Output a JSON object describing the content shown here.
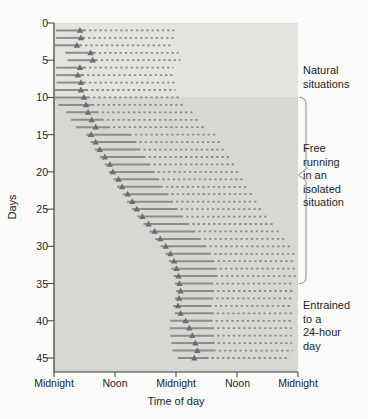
{
  "colors": {
    "page_bg": "#fbfbf9",
    "plot_bg_upper": "#e3e3e0",
    "plot_bg_lower": "#d7d7d3",
    "line": "#8c8e8c",
    "marker": "#6b6d70",
    "axis": "#3c3c3a",
    "bracket": "#8a8a88",
    "text": "#1e1e1e"
  },
  "chart_data": {
    "type": "actogram",
    "xlabel": "Time of day",
    "ylabel": "Days",
    "x_range_hours": [
      0,
      48
    ],
    "y_range_days": [
      0,
      45
    ],
    "grid": "off",
    "x_ticks": [
      {
        "hour": 0,
        "label": "Midnight"
      },
      {
        "hour": 12,
        "label": "Noon"
      },
      {
        "hour": 24,
        "label": "Midnight"
      },
      {
        "hour": 36,
        "label": "Noon"
      },
      {
        "hour": 48,
        "label": "Midnight"
      }
    ],
    "y_ticks": [
      "0",
      "5",
      "10",
      "15",
      "20",
      "25",
      "30",
      "35",
      "40",
      "45"
    ],
    "regimes": [
      {
        "label_lines": [
          "Natural",
          "situations"
        ],
        "day_start": 0,
        "day_end": 10,
        "bracket": false
      },
      {
        "label_lines": [
          "Free",
          "running",
          "in an",
          "isolated",
          "situation"
        ],
        "day_start": 10,
        "day_end": 35,
        "bracket": true
      },
      {
        "label_lines": [
          "Entrained",
          "to a",
          "24-hour",
          "day"
        ],
        "day_start": 35,
        "day_end": 45,
        "bracket": false
      }
    ],
    "days": [
      {
        "day": 1,
        "solid": [
          0.4,
          6.3
        ],
        "marker": 5.1,
        "dashed": [
          6.9,
          23.7
        ]
      },
      {
        "day": 2,
        "solid": [
          0.4,
          6.1
        ],
        "marker": 5.3,
        "dashed": [
          6.7,
          23.7
        ]
      },
      {
        "day": 3,
        "solid": [
          0.2,
          5.5
        ],
        "marker": 4.5,
        "dashed": [
          6.1,
          23.1
        ]
      },
      {
        "day": 4,
        "solid": [
          2.2,
          8.2
        ],
        "marker": 7.2,
        "dashed": [
          8.8,
          24.5
        ]
      },
      {
        "day": 5,
        "solid": [
          2.7,
          8.6
        ],
        "marker": 7.6,
        "dashed": [
          9.2,
          24.9
        ]
      },
      {
        "day": 6,
        "solid": [
          0.4,
          6.3
        ],
        "marker": 5.1,
        "dashed": [
          6.9,
          23.5
        ]
      },
      {
        "day": 7,
        "solid": [
          0.4,
          5.9
        ],
        "marker": 4.7,
        "dashed": [
          6.5,
          23.3
        ]
      },
      {
        "day": 8,
        "solid": [
          0.5,
          6.3
        ],
        "marker": 5.3,
        "dashed": [
          6.9,
          23.7
        ]
      },
      {
        "day": 9,
        "solid": [
          0.0,
          6.7
        ],
        "marker": 5.3,
        "dashed": [
          7.3,
          23.9
        ]
      },
      {
        "day": 10,
        "solid": [
          0.0,
          7.1
        ],
        "marker": 5.9,
        "dashed": [
          7.7,
          24.7
        ]
      },
      {
        "day": 11,
        "solid": [
          0.9,
          7.9
        ],
        "marker": 6.3,
        "dashed": [
          8.5,
          25.9
        ]
      },
      {
        "day": 12,
        "solid": [
          2.4,
          8.8
        ],
        "marker": 6.7,
        "dashed": [
          9.4,
          27.3
        ]
      },
      {
        "day": 13,
        "solid": [
          3.3,
          9.8
        ],
        "marker": 7.4,
        "dashed": [
          10.4,
          28.6
        ]
      },
      {
        "day": 14,
        "solid": [
          4.3,
          11.0
        ],
        "marker": 8.2,
        "dashed": [
          11.6,
          29.9
        ]
      },
      {
        "day": 15,
        "solid": [
          6.3,
          15.3
        ],
        "marker": 7.3,
        "dashed": [
          15.9,
          32.1
        ]
      },
      {
        "day": 16,
        "solid": [
          7.2,
          16.2
        ],
        "marker": 8.2,
        "dashed": [
          16.8,
          33.0
        ]
      },
      {
        "day": 17,
        "solid": [
          8.0,
          17.0
        ],
        "marker": 9.0,
        "dashed": [
          17.6,
          33.8
        ]
      },
      {
        "day": 18,
        "solid": [
          9.0,
          18.0
        ],
        "marker": 10.0,
        "dashed": [
          18.6,
          34.8
        ]
      },
      {
        "day": 19,
        "solid": [
          10.0,
          19.0
        ],
        "marker": 11.0,
        "dashed": [
          19.6,
          35.8
        ]
      },
      {
        "day": 20,
        "solid": [
          10.8,
          19.8
        ],
        "marker": 11.6,
        "dashed": [
          20.4,
          36.8
        ]
      },
      {
        "day": 21,
        "solid": [
          11.7,
          20.7
        ],
        "marker": 12.7,
        "dashed": [
          21.3,
          37.5
        ]
      },
      {
        "day": 22,
        "solid": [
          12.4,
          21.4
        ],
        "marker": 13.4,
        "dashed": [
          22.0,
          38.2
        ]
      },
      {
        "day": 23,
        "solid": [
          13.5,
          22.5
        ],
        "marker": 14.5,
        "dashed": [
          23.1,
          39.3
        ]
      },
      {
        "day": 24,
        "solid": [
          14.4,
          23.4
        ],
        "marker": 15.4,
        "dashed": [
          24.0,
          40.2
        ]
      },
      {
        "day": 25,
        "solid": [
          15.3,
          24.3
        ],
        "marker": 16.3,
        "dashed": [
          24.9,
          41.1
        ]
      },
      {
        "day": 26,
        "solid": [
          16.4,
          25.4
        ],
        "marker": 17.4,
        "dashed": [
          26.0,
          42.2
        ]
      },
      {
        "day": 27,
        "solid": [
          17.6,
          26.6
        ],
        "marker": 18.6,
        "dashed": [
          27.2,
          43.4
        ]
      },
      {
        "day": 28,
        "solid": [
          18.8,
          27.8
        ],
        "marker": 19.8,
        "dashed": [
          28.4,
          44.6
        ]
      },
      {
        "day": 29,
        "solid": [
          19.9,
          28.9
        ],
        "marker": 20.9,
        "dashed": [
          29.5,
          45.7
        ]
      },
      {
        "day": 30,
        "solid": [
          21.0,
          30.0
        ],
        "marker": 22.0,
        "dashed": [
          30.6,
          46.8
        ]
      },
      {
        "day": 31,
        "solid": [
          21.9,
          30.9
        ],
        "marker": 22.9,
        "dashed": [
          31.5,
          47.5
        ]
      },
      {
        "day": 32,
        "solid": [
          22.6,
          31.6
        ],
        "marker": 23.6,
        "dashed": [
          32.2,
          47.5
        ]
      },
      {
        "day": 33,
        "solid": [
          23.1,
          32.0
        ],
        "marker": 24.1,
        "dashed": [
          32.6,
          47.6
        ]
      },
      {
        "day": 34,
        "solid": [
          23.5,
          32.2
        ],
        "marker": 24.5,
        "dashed": [
          32.8,
          47.6
        ]
      },
      {
        "day": 35,
        "solid": [
          23.8,
          31.3
        ],
        "marker": 24.7,
        "dashed": [
          31.9,
          46.8
        ]
      },
      {
        "day": 36,
        "solid": [
          24.0,
          31.5
        ],
        "marker": 24.9,
        "dashed": [
          32.1,
          47.0
        ]
      },
      {
        "day": 37,
        "solid": [
          23.8,
          31.3
        ],
        "marker": 24.6,
        "dashed": [
          31.9,
          46.8
        ]
      },
      {
        "day": 38,
        "solid": [
          23.4,
          31.0
        ],
        "marker": 24.4,
        "dashed": [
          31.6,
          46.6
        ]
      },
      {
        "day": 39,
        "solid": [
          23.8,
          31.4
        ],
        "marker": 24.9,
        "dashed": [
          32.0,
          46.9
        ]
      },
      {
        "day": 40,
        "solid": [
          22.9,
          31.2
        ],
        "marker": 25.9,
        "dashed": [
          31.8,
          46.6
        ]
      },
      {
        "day": 41,
        "solid": [
          22.8,
          31.5
        ],
        "marker": 26.6,
        "dashed": [
          32.1,
          46.8
        ]
      },
      {
        "day": 42,
        "solid": [
          22.9,
          31.5
        ],
        "marker": 27.2,
        "dashed": [
          32.1,
          46.7
        ]
      },
      {
        "day": 43,
        "solid": [
          23.1,
          31.6
        ],
        "marker": 27.8,
        "dashed": [
          32.2,
          46.8
        ]
      },
      {
        "day": 44,
        "solid": [
          23.3,
          31.8
        ],
        "marker": 28.2,
        "dashed": [
          32.4,
          46.9
        ]
      },
      {
        "day": 45,
        "solid": [
          24.3,
          30.4
        ],
        "marker": 27.6,
        "dashed": [
          31.0,
          46.4
        ]
      }
    ]
  }
}
